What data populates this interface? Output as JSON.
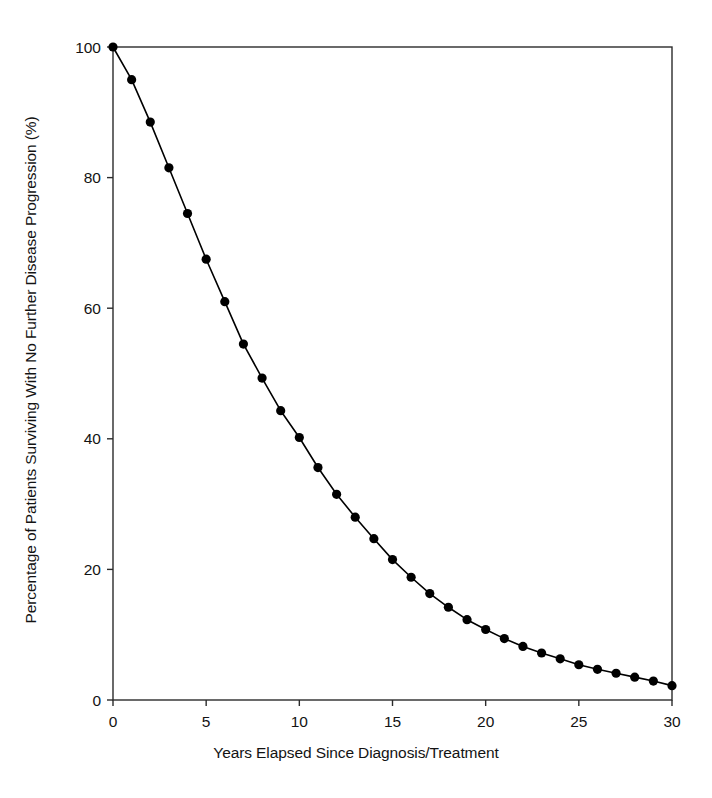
{
  "chart_data": {
    "type": "line",
    "title": "",
    "xlabel": "Years Elapsed Since Diagnosis/Treatment",
    "ylabel": "Percentage of Patients Surviving With No Further Disease Progression (%)",
    "xlim": [
      0,
      30
    ],
    "ylim": [
      0,
      100
    ],
    "xticks": [
      0,
      5,
      10,
      15,
      20,
      25,
      30
    ],
    "xticklabels": [
      "0",
      "5",
      "10",
      "15",
      "20",
      "25",
      "30"
    ],
    "yticks": [
      0,
      20,
      40,
      60,
      80,
      100
    ],
    "yticklabels": [
      "0",
      "20",
      "40",
      "60",
      "80",
      "100"
    ],
    "grid": false,
    "legend": null,
    "marker": "filled-circle",
    "marker_color": "#000000",
    "line_color": "#000000",
    "series": [
      {
        "name": "Progression-free survival",
        "x": [
          0,
          1,
          2,
          3,
          4,
          5,
          6,
          7,
          8,
          9,
          10,
          11,
          12,
          13,
          14,
          15,
          16,
          17,
          18,
          19,
          20,
          21,
          22,
          23,
          24,
          25,
          26,
          27,
          28,
          29,
          30
        ],
        "values": [
          100,
          95,
          88.5,
          81.5,
          74.5,
          67.5,
          61,
          54.5,
          49.3,
          44.3,
          40.2,
          35.6,
          31.5,
          28,
          24.7,
          21.5,
          18.8,
          16.3,
          14.2,
          12.3,
          10.8,
          9.4,
          8.2,
          7.2,
          6.3,
          5.4,
          4.7,
          4.1,
          3.5,
          2.9,
          2.2
        ]
      }
    ]
  }
}
